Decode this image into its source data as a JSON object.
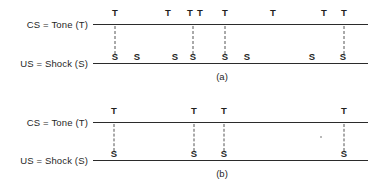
{
  "figure": {
    "background_color": "#ffffff",
    "line_color": "#2b2b2b",
    "dash_color": "#555555",
    "text_color": "#1f1f1f"
  },
  "panels": [
    {
      "id": "panel-a",
      "caption": "(a)",
      "caption_x": 222,
      "caption_y": 71,
      "axis_left": 93,
      "axis_right": 368,
      "cs_row": {
        "label": "CS = Tone (T)",
        "label_x": 55,
        "label_y": 19,
        "line_y": 24,
        "marks": [
          {
            "symbol": "T",
            "x": 115
          },
          {
            "symbol": "T",
            "x": 168
          },
          {
            "symbol": "T",
            "x": 190
          },
          {
            "symbol": "T",
            "x": 200
          },
          {
            "symbol": "T",
            "x": 225
          },
          {
            "symbol": "T",
            "x": 273
          },
          {
            "symbol": "T",
            "x": 324
          },
          {
            "symbol": "T",
            "x": 344
          }
        ]
      },
      "us_row": {
        "label": "US = Shock (S)",
        "label_x": 55,
        "label_y": 58,
        "line_y": 63,
        "marks": [
          {
            "symbol": "S",
            "x": 115
          },
          {
            "symbol": "S",
            "x": 137
          },
          {
            "symbol": "S",
            "x": 175
          },
          {
            "symbol": "S",
            "x": 193
          },
          {
            "symbol": "S",
            "x": 225
          },
          {
            "symbol": "S",
            "x": 247
          },
          {
            "symbol": "S",
            "x": 312
          },
          {
            "symbol": "S",
            "x": 343
          }
        ]
      },
      "connectors": [
        {
          "x": 115,
          "y_top": 26,
          "y_bottom": 54
        },
        {
          "x": 193,
          "y_top": 26,
          "y_bottom": 54
        },
        {
          "x": 225,
          "y_top": 26,
          "y_bottom": 54
        },
        {
          "x": 344,
          "y_top": 26,
          "y_bottom": 54
        }
      ],
      "specks": []
    },
    {
      "id": "panel-b",
      "caption": "(b)",
      "caption_x": 222,
      "caption_y": 168,
      "axis_left": 93,
      "axis_right": 368,
      "cs_row": {
        "label": "CS = Tone (T)",
        "label_x": 55,
        "label_y": 117,
        "line_y": 122,
        "marks": [
          {
            "symbol": "T",
            "x": 114
          },
          {
            "symbol": "T",
            "x": 194
          },
          {
            "symbol": "T",
            "x": 224
          },
          {
            "symbol": "T",
            "x": 344
          }
        ]
      },
      "us_row": {
        "label": "US = Shock (S)",
        "label_x": 55,
        "label_y": 155,
        "line_y": 160,
        "marks": [
          {
            "symbol": "S",
            "x": 114
          },
          {
            "symbol": "S",
            "x": 194
          },
          {
            "symbol": "S",
            "x": 224
          },
          {
            "symbol": "S",
            "x": 344
          }
        ]
      },
      "connectors": [
        {
          "x": 114,
          "y_top": 124,
          "y_bottom": 151
        },
        {
          "x": 194,
          "y_top": 124,
          "y_bottom": 151
        },
        {
          "x": 224,
          "y_top": 124,
          "y_bottom": 151
        },
        {
          "x": 344,
          "y_top": 124,
          "y_bottom": 151
        }
      ],
      "specks": [
        {
          "x": 320,
          "y": 136
        }
      ]
    }
  ]
}
